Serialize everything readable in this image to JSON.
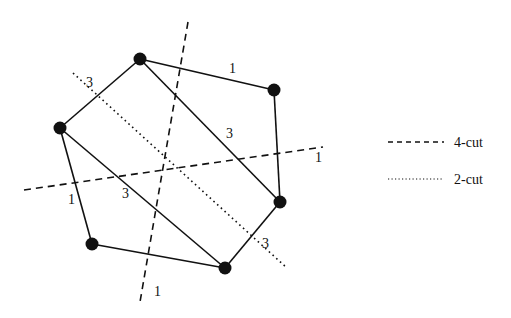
{
  "diagram": {
    "nodes": [
      {
        "id": "n_top",
        "x": 140,
        "y": 59
      },
      {
        "id": "n_right_top",
        "x": 274,
        "y": 90
      },
      {
        "id": "n_left",
        "x": 60,
        "y": 128
      },
      {
        "id": "n_right_bottom",
        "x": 280,
        "y": 202
      },
      {
        "id": "n_bottom_left",
        "x": 92,
        "y": 244
      },
      {
        "id": "n_bottom",
        "x": 225,
        "y": 268
      }
    ],
    "edges": [
      {
        "from": "n_top",
        "to": "n_right_top",
        "weight": "1"
      },
      {
        "from": "n_right_top",
        "to": "n_right_bottom",
        "weight": "1"
      },
      {
        "from": "n_top",
        "to": "n_left",
        "weight": "3"
      },
      {
        "from": "n_top",
        "to": "n_right_bottom",
        "weight": "3"
      },
      {
        "from": "n_left",
        "to": "n_bottom_left",
        "weight": "1"
      },
      {
        "from": "n_left",
        "to": "n_bottom",
        "weight": "3"
      },
      {
        "from": "n_bottom_left",
        "to": "n_bottom",
        "weight": "1"
      },
      {
        "from": "n_bottom",
        "to": "n_right_bottom",
        "weight": "3"
      }
    ],
    "edge_labels": [
      {
        "text": "1",
        "x": 229,
        "y": 73
      },
      {
        "text": "3",
        "x": 226,
        "y": 138
      },
      {
        "text": "3",
        "x": 86,
        "y": 87
      },
      {
        "text": "1",
        "x": 315,
        "y": 162
      },
      {
        "text": "1",
        "x": 68,
        "y": 204
      },
      {
        "text": "3",
        "x": 122,
        "y": 198
      },
      {
        "text": "1",
        "x": 154,
        "y": 296
      },
      {
        "text": "3",
        "x": 262,
        "y": 248
      }
    ],
    "cuts": [
      {
        "type": "4-cut",
        "x1": 188,
        "y1": 22,
        "x2": 140,
        "y2": 302
      },
      {
        "type": "4-cut",
        "x1": 24,
        "y1": 190,
        "x2": 323,
        "y2": 147
      },
      {
        "type": "2-cut",
        "x1": 73,
        "y1": 73,
        "x2": 287,
        "y2": 268
      }
    ]
  },
  "legend": {
    "items": [
      {
        "label": "4-cut",
        "style": "dashed"
      },
      {
        "label": "2-cut",
        "style": "dotted"
      }
    ]
  }
}
